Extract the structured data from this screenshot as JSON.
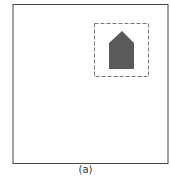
{
  "figure": {
    "caption": "(a)",
    "colors": {
      "frame": "#444444",
      "dashed_box": "#777777",
      "shape_fill": "#5a5a5a",
      "background": "#ffffff"
    },
    "elements": [
      {
        "type": "frame",
        "shape": "square",
        "style": "solid"
      },
      {
        "type": "selection-box",
        "style": "dashed"
      },
      {
        "type": "pentagon",
        "description": "house-shaped filled polygon"
      }
    ]
  }
}
